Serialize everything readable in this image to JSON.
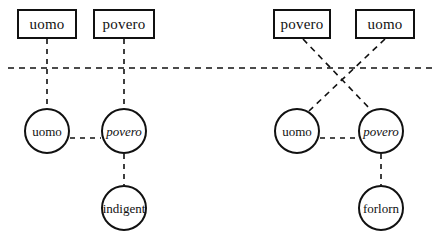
{
  "diagram": {
    "stroke_color": "#111111",
    "background_color": "#ffffff",
    "panels": [
      {
        "name": "left-panel",
        "boxes": [
          {
            "id": "l-box-uomo",
            "label": "uomo",
            "style": "upright",
            "x": 17,
            "y": 9,
            "w": 60,
            "h": 30
          },
          {
            "id": "l-box-povero",
            "label": "povero",
            "style": "upright",
            "x": 93,
            "y": 9,
            "w": 62,
            "h": 30
          }
        ],
        "circles": [
          {
            "id": "l-cir-uomo",
            "label": "uomo",
            "style": "upright",
            "cx": 47,
            "cy": 131,
            "r": 23
          },
          {
            "id": "l-cir-povero",
            "label": "povero",
            "style": "italic",
            "cx": 124,
            "cy": 131,
            "r": 23
          },
          {
            "id": "l-cir-indigent",
            "label": "indigent",
            "style": "upright",
            "cx": 124,
            "cy": 208,
            "r": 23
          }
        ],
        "links": [
          {
            "from": "l-box-uomo",
            "to": "l-cir-uomo",
            "kind": "vertical"
          },
          {
            "from": "l-box-povero",
            "to": "l-cir-povero",
            "kind": "vertical"
          },
          {
            "from": "l-cir-uomo",
            "to": "l-cir-povero",
            "kind": "horizontal"
          },
          {
            "from": "l-cir-povero",
            "to": "l-cir-indigent",
            "kind": "vertical"
          }
        ]
      },
      {
        "name": "right-panel",
        "boxes": [
          {
            "id": "r-box-povero",
            "label": "povero",
            "style": "upright",
            "x": 273,
            "y": 9,
            "w": 58,
            "h": 30
          },
          {
            "id": "r-box-uomo",
            "label": "uomo",
            "style": "upright",
            "x": 355,
            "y": 9,
            "w": 60,
            "h": 30
          }
        ],
        "circles": [
          {
            "id": "r-cir-uomo",
            "label": "uomo",
            "style": "upright",
            "cx": 297,
            "cy": 131,
            "r": 23
          },
          {
            "id": "r-cir-povero",
            "label": "povero",
            "style": "italic",
            "cx": 381,
            "cy": 131,
            "r": 23
          },
          {
            "id": "r-cir-forlorn",
            "label": "forlorn",
            "style": "upright",
            "cx": 381,
            "cy": 208,
            "r": 23
          }
        ],
        "links": [
          {
            "from": "r-box-povero",
            "to": "r-cir-povero",
            "kind": "crossing"
          },
          {
            "from": "r-box-uomo",
            "to": "r-cir-uomo",
            "kind": "crossing"
          },
          {
            "from": "r-cir-uomo",
            "to": "r-cir-povero",
            "kind": "horizontal"
          },
          {
            "from": "r-cir-povero",
            "to": "r-cir-forlorn",
            "kind": "vertical"
          }
        ]
      }
    ],
    "divider": {
      "name": "horizontal-divider",
      "y": 68,
      "x1": 8,
      "x2": 437
    }
  }
}
